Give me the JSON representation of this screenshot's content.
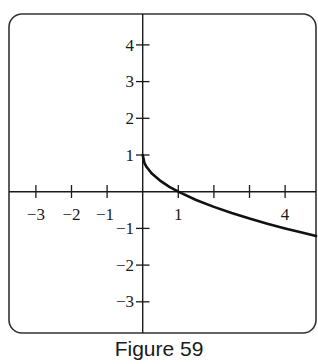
{
  "chart_data": {
    "type": "line",
    "title": "",
    "caption": "Figure 59",
    "xlabel": "",
    "ylabel": "",
    "xlim": [
      -3.8,
      4.87
    ],
    "ylim": [
      -3.9,
      4.9
    ],
    "grid": false,
    "legend": null,
    "x_ticks": [
      -3,
      -2,
      -1,
      1,
      2,
      3,
      4
    ],
    "x_tick_labels": [
      "−3",
      "−2",
      "−1",
      "",
      "1",
      "",
      "",
      "4"
    ],
    "x_tick_labels_shown": {
      "-3": "−3",
      "-2": "−2",
      "-1": "−1",
      "1": "1",
      "4": "4"
    },
    "y_ticks": [
      -3,
      -2,
      -1,
      1,
      2,
      3,
      4
    ],
    "y_tick_labels_shown": {
      "-3": "−3",
      "-2": "−2",
      "-1": "−1",
      "1": "1",
      "2": "2",
      "3": "3",
      "4": "4"
    },
    "series": [
      {
        "name": "f(x) = 1 − √x",
        "x": [
          0,
          0.05,
          0.1,
          0.25,
          0.5,
          0.75,
          1,
          1.5,
          2,
          2.5,
          3,
          3.5,
          4,
          4.5,
          4.87
        ],
        "values": [
          1,
          0.776,
          0.684,
          0.5,
          0.293,
          0.134,
          0,
          -0.225,
          -0.414,
          -0.581,
          -0.732,
          -0.871,
          -1,
          -1.121,
          -1.207
        ]
      }
    ]
  },
  "figure": {
    "caption": "Figure 59",
    "labels": {
      "xm3": "−3",
      "xm2": "−2",
      "xm1": "−1",
      "x1": "1",
      "x4": "4",
      "y4": "4",
      "y3": "3",
      "y2": "2",
      "y1": "1",
      "ym1": "−1",
      "ym2": "−2",
      "ym3": "−3"
    },
    "colors": {
      "axis": "#1a1a1a",
      "curve": "#111111",
      "frame": "#333333",
      "background": "#ffffff"
    }
  }
}
